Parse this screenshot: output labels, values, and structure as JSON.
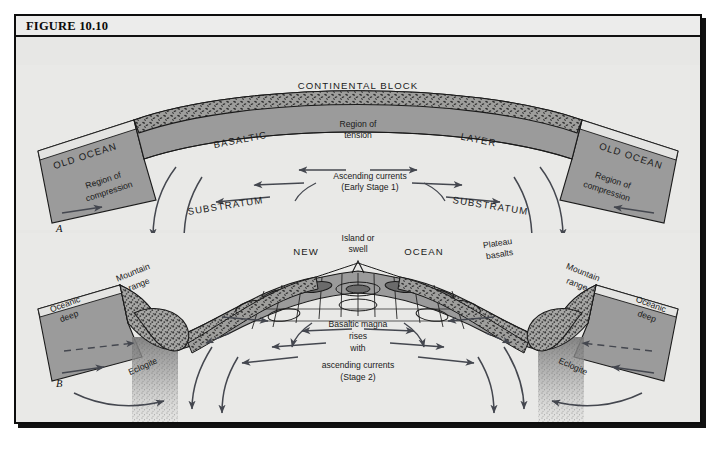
{
  "figure": {
    "number_label": "FIGURE 10.10",
    "background_color": "#e7e7e5",
    "frame_color": "#0d0d0d"
  },
  "palette": {
    "substratum": "#e9e9e7",
    "basaltic_layer": "#9b9b9b",
    "ocean_block": "#9b9b9b",
    "continental_crust_stipple": "#575757",
    "arrow_color": "#44474f",
    "outline": "#1a1a1a",
    "eclogite_stipple": "#8d8d8d"
  },
  "panels": [
    {
      "id": "A",
      "panel_label": "A",
      "stage_caption": "Ascending currents\n(Early Stage 1)",
      "labels": [
        {
          "name": "continental-block",
          "text": "CONTINENTAL BLOCK",
          "style": "caps"
        },
        {
          "name": "old-ocean-left",
          "text": "OLD OCEAN",
          "style": "caps"
        },
        {
          "name": "old-ocean-right",
          "text": "OLD OCEAN",
          "style": "caps"
        },
        {
          "name": "basaltic",
          "text": "BASALTIC",
          "style": "caps"
        },
        {
          "name": "layer",
          "text": "LAYER",
          "style": "caps"
        },
        {
          "name": "region-of-tension",
          "text": "Region of tension",
          "style": "small"
        },
        {
          "name": "region-of-compression-left",
          "text": "Region of compression",
          "style": "small"
        },
        {
          "name": "region-of-compression-right",
          "text": "Region of compression",
          "style": "small"
        },
        {
          "name": "substratum-left",
          "text": "SUBSTRATUM",
          "style": "caps"
        },
        {
          "name": "substratum-right",
          "text": "SUBSTRATUM",
          "style": "caps"
        },
        {
          "name": "ascending-currents",
          "text": "Ascending currents",
          "style": "small"
        },
        {
          "name": "early-stage-1",
          "text": "(Early Stage 1)",
          "style": "small"
        }
      ]
    },
    {
      "id": "B",
      "panel_label": "B",
      "stage_caption": "Basaltic magna rises with ascending currents (Stage 2)",
      "labels": [
        {
          "name": "island-or-swell",
          "text": "Island or swell",
          "style": "small"
        },
        {
          "name": "new-ocean-new",
          "text": "NEW",
          "style": "caps"
        },
        {
          "name": "new-ocean-ocean",
          "text": "OCEAN",
          "style": "caps"
        },
        {
          "name": "plateau-basalts",
          "text": "Plateau basalts",
          "style": "small"
        },
        {
          "name": "mountain-range-left",
          "text": "Mountain range",
          "style": "small"
        },
        {
          "name": "mountain-range-right",
          "text": "Mountain range",
          "style": "small"
        },
        {
          "name": "oceanic-deep-left",
          "text": "Oceanic deep",
          "style": "small"
        },
        {
          "name": "oceanic-deep-right",
          "text": "Oceanic deep",
          "style": "small"
        },
        {
          "name": "eclogite-left",
          "text": "Eclogite",
          "style": "small"
        },
        {
          "name": "eclogite-right",
          "text": "Eclogite",
          "style": "small"
        },
        {
          "name": "basaltic-magna",
          "text": "Basaltic magna",
          "style": "small"
        },
        {
          "name": "rises",
          "text": "rises",
          "style": "small"
        },
        {
          "name": "with",
          "text": "with",
          "style": "small"
        },
        {
          "name": "ascending-currents",
          "text": "ascending currents",
          "style": "small"
        },
        {
          "name": "stage-2",
          "text": "(Stage 2)",
          "style": "small"
        }
      ]
    }
  ],
  "text": {
    "continental_block": "CONTINENTAL BLOCK",
    "old_ocean": "OLD OCEAN",
    "basaltic": "BASALTIC",
    "layer": "LAYER",
    "region_of": "Region of",
    "tension": "tension",
    "compression": "compression",
    "substratum": "SUBSTRATUM",
    "ascending_currents_caps": "Ascending currents",
    "early_stage_1": "(Early Stage 1)",
    "island_or": "Island or",
    "swell": "swell",
    "new": "NEW",
    "ocean": "OCEAN",
    "plateau": "Plateau",
    "basalts": "basalts",
    "mountain": "Mountain",
    "range": "range",
    "oceanic": "Oceanic",
    "deep": "deep",
    "eclogite": "Eclogite",
    "basaltic_magna": "Basaltic magna",
    "rises": "rises",
    "with": "with",
    "ascending_currents": "ascending currents",
    "stage_2": "(Stage 2)",
    "panel_a": "A",
    "panel_b": "B"
  }
}
